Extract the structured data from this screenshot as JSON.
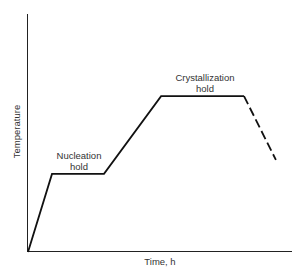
{
  "chart_data": {
    "type": "line",
    "title": "",
    "xlabel": "Time, h",
    "ylabel": "Temperature",
    "grid": false,
    "legend": null,
    "axis_ticks": "none (schematic, unlabeled scale)",
    "xlim": [
      0,
      1
    ],
    "ylim": [
      0,
      1
    ],
    "series": [
      {
        "name": "Heat-treatment profile",
        "style": "solid",
        "x": [
          0.0,
          0.091,
          0.288,
          0.504,
          0.818
        ],
        "y": [
          0.0,
          0.328,
          0.328,
          0.655,
          0.655
        ]
      },
      {
        "name": "Cooling",
        "style": "dashed",
        "x": [
          0.818,
          0.939
        ],
        "y": [
          0.655,
          0.387
        ]
      }
    ],
    "annotations": [
      {
        "text": "Nucleation\nhold",
        "segment": "first plateau"
      },
      {
        "text": "Crystallization\nhold",
        "segment": "second plateau"
      }
    ]
  },
  "labels": {
    "ylabel": "Temperature",
    "xlabel": "Time, h",
    "nucleation_line1": "Nucleation",
    "nucleation_line2": "hold",
    "crystallization_line1": "Crystallization",
    "crystallization_line2": "hold"
  },
  "colors": {
    "line": "#111111",
    "axis": "#222222",
    "text": "#333333"
  }
}
